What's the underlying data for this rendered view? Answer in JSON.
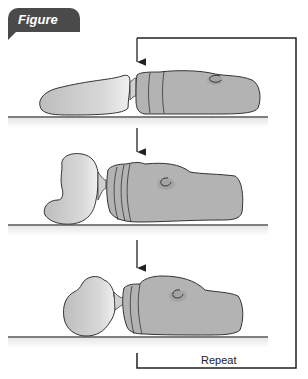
{
  "figure": {
    "label": "Figure 14.6",
    "loop_label": "Repeat",
    "colors": {
      "badge": "#4a4a4a",
      "body_fill": "#b3b3b3",
      "bulb_fill": "#c8c8c8",
      "outline": "#333333",
      "ground": "#555555"
    },
    "stages": [
      {
        "name": "stage-1-extended"
      },
      {
        "name": "stage-2-contracting"
      },
      {
        "name": "stage-3-contracted"
      }
    ]
  }
}
